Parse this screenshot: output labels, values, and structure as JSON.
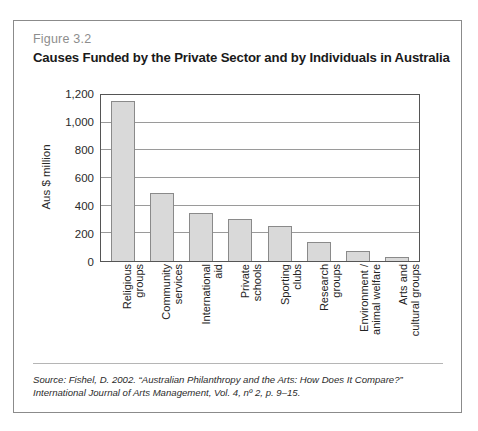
{
  "figure": {
    "number": "Figure 3.2",
    "title": "Causes Funded by the Private Sector and by Individuals in Australia",
    "source_line_1": "Source: Fishel, D. 2002. “Australian Philanthropy and the Arts: How Does It Compare?”",
    "source_line_2": "International Journal of Arts Management, Vol. 4, nº 2, p. 9–15."
  },
  "colors": {
    "bar_fill": "#d9d9d9",
    "bar_border": "#8a8a8a",
    "frame": "#8b8b8b",
    "gridline": "#9a9a9a",
    "figure_number": "#8d8d8d",
    "title": "#1a1a1a"
  },
  "chart_data": {
    "type": "bar",
    "title": "Causes Funded by the Private Sector and by Individuals in Australia",
    "xlabel": "",
    "ylabel": "Aus $ million",
    "ylim": [
      0,
      1200
    ],
    "ytick_values": [
      0,
      200,
      400,
      600,
      800,
      1000,
      1200
    ],
    "ytick_labels": [
      "0",
      "200",
      "400",
      "600",
      "800",
      "1,000",
      "1,200"
    ],
    "grid": true,
    "legend": false,
    "categories": [
      "Religious groups",
      "Community services",
      "International aid",
      "Private schools",
      "Sporting clubs",
      "Research groups",
      "Environment / animal welfare",
      "Arts and cultural groups"
    ],
    "category_lines": [
      [
        "Religious",
        "groups"
      ],
      [
        "Community",
        "services"
      ],
      [
        "International",
        "aid"
      ],
      [
        "Private",
        "schools"
      ],
      [
        "Sporting",
        "clubs"
      ],
      [
        "Research",
        "groups"
      ],
      [
        "Environment /",
        "animal welfare"
      ],
      [
        "Arts and",
        "cultural groups"
      ]
    ],
    "values": [
      1160,
      490,
      350,
      305,
      250,
      140,
      75,
      30
    ]
  }
}
